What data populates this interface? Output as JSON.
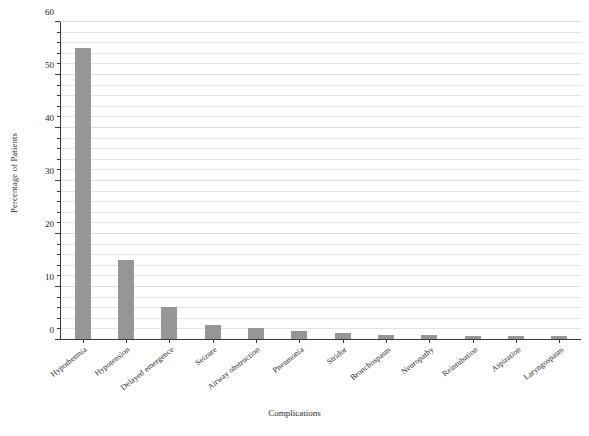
{
  "chart_data": {
    "type": "bar",
    "title": "",
    "xlabel": "Complications",
    "ylabel": "Percentage of Patients",
    "ylim": [
      0,
      60
    ],
    "ytick_labels": [
      "0",
      "10",
      "20",
      "30",
      "40",
      "50",
      "60"
    ],
    "ytick_values": [
      0,
      10,
      20,
      30,
      40,
      50,
      60
    ],
    "minor_tick_step": 2,
    "grid": true,
    "grid_axis": "y",
    "legend": "none",
    "bar_color": "#969696",
    "axis_color": "#3a3a3a",
    "gridline_color": "#e4e4e4",
    "categories": [
      "Hypothermia",
      "Hypotension",
      "Delayed emergence",
      "Seizure",
      "Airway obstruction",
      "Pneumonia",
      "Stridor",
      "Bronchospasm",
      "Neuropathy",
      "Reintubation",
      "Aspiration",
      "Laryngospasm"
    ],
    "values": [
      55,
      15,
      6,
      2.6,
      2,
      1.6,
      1.1,
      0.8,
      0.8,
      0.5,
      0.5,
      0.5
    ]
  }
}
